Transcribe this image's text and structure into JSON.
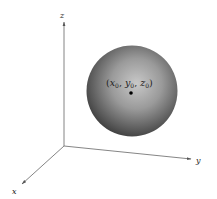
{
  "figure": {
    "axes": {
      "x": {
        "label": "x"
      },
      "y": {
        "label": "y"
      },
      "z": {
        "label": "z"
      }
    },
    "center_point": {
      "label_open": "(",
      "x_var": "x",
      "y_var": "y",
      "z_var": "z",
      "subscript": "0",
      "separator": ", ",
      "label_close": ")"
    },
    "colors": {
      "axis": "#555555",
      "sphere_light": "#bdbdbd",
      "sphere_dark": "#3a3a3a",
      "point": "#000000"
    }
  }
}
